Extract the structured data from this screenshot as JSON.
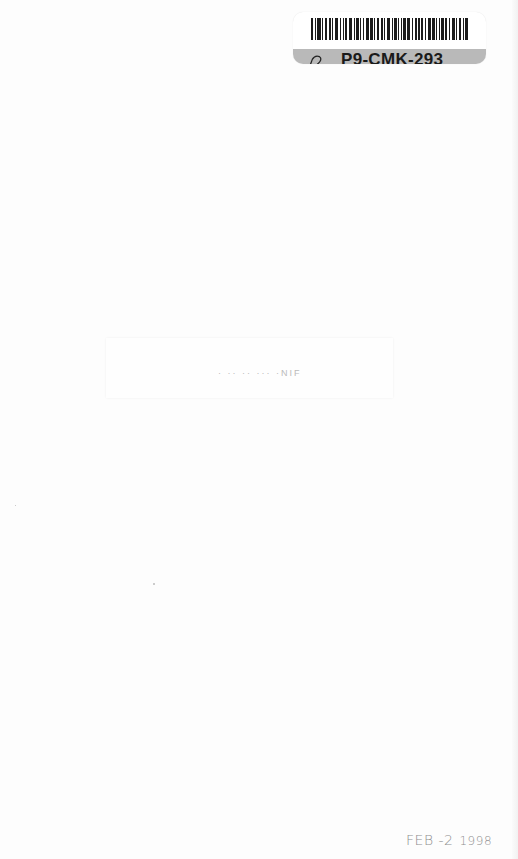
{
  "library_label": {
    "call_number": "P9-CMK-293",
    "icon": "bell-icon",
    "strip_color": "#b9b9b9",
    "bar_widths": [
      2,
      1,
      3,
      1,
      2,
      2,
      1,
      3,
      1,
      1,
      2,
      3,
      1,
      2,
      1,
      1,
      3,
      2,
      1,
      2,
      2,
      1,
      3,
      1,
      2,
      1,
      1,
      2,
      3,
      1,
      2,
      1,
      2,
      1,
      3,
      2,
      1,
      1,
      2,
      2,
      1,
      3,
      1,
      2,
      1,
      2
    ]
  },
  "faded_title": {
    "text": "· ·· ·· ··· ·NIF"
  },
  "date_stamp": {
    "month_day": "FEB -2",
    "year": "1998"
  }
}
